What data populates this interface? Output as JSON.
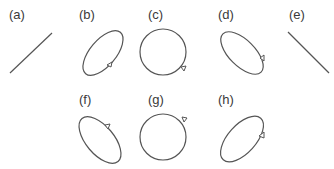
{
  "figure": {
    "panels": [
      {
        "id": "a",
        "label": "(a)",
        "shape": "line",
        "orientation": "rising"
      },
      {
        "id": "b",
        "label": "(b)",
        "shape": "ellipse",
        "orientation": "rising",
        "arrow": "lower-right"
      },
      {
        "id": "c",
        "label": "(c)",
        "shape": "circle",
        "arrow": "lower-right"
      },
      {
        "id": "d",
        "label": "(d)",
        "shape": "ellipse",
        "orientation": "falling",
        "arrow": "right"
      },
      {
        "id": "e",
        "label": "(e)",
        "shape": "line",
        "orientation": "falling"
      },
      {
        "id": "f",
        "label": "(f)",
        "shape": "ellipse",
        "orientation": "falling",
        "arrow": "upper-right"
      },
      {
        "id": "g",
        "label": "(g)",
        "shape": "circle",
        "arrow": "upper-right"
      },
      {
        "id": "h",
        "label": "(h)",
        "shape": "ellipse",
        "orientation": "rising",
        "arrow": "right"
      }
    ],
    "colors": {
      "stroke": "#555555",
      "text": "#3a3a3a",
      "background": "#ffffff"
    }
  }
}
